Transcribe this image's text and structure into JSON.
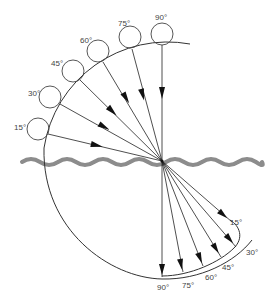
{
  "diagram": {
    "type": "refraction-of-incident-rays-at-water-surface",
    "colors": {
      "line": "#222222",
      "water": "#8c8c8c",
      "label": "#444444",
      "background": "#ffffff"
    },
    "incident_labels": [
      "15°",
      "30°",
      "45°",
      "60°",
      "75°",
      "90°"
    ],
    "refracted_labels": [
      "15°",
      "30°",
      "45°",
      "60°",
      "75°",
      "90°"
    ],
    "incident": [
      {
        "angle": "15°",
        "label_x": 17,
        "label_y": 130,
        "ball_cx": 38,
        "ball_cy": 129,
        "start_x": 48,
        "start_y": 134
      },
      {
        "angle": "30°",
        "label_x": 32,
        "label_y": 95,
        "ball_cx": 50,
        "ball_cy": 97,
        "start_x": 60,
        "start_y": 104
      },
      {
        "angle": "45°",
        "label_x": 54,
        "label_y": 65,
        "ball_cx": 73,
        "ball_cy": 71,
        "start_x": 80,
        "start_y": 80
      },
      {
        "angle": "60°",
        "label_x": 82,
        "label_y": 43,
        "ball_cx": 98,
        "ball_cy": 51,
        "start_x": 103,
        "start_y": 62
      },
      {
        "angle": "75°",
        "label_x": 120,
        "label_y": 26,
        "ball_cx": 130,
        "ball_cy": 38,
        "start_x": 132,
        "start_y": 50
      },
      {
        "angle": "90°",
        "label_x": 156,
        "label_y": 19,
        "ball_cx": 162,
        "ball_cy": 34,
        "start_x": 162,
        "start_y": 46
      }
    ],
    "refracted": [
      {
        "angle": "15°",
        "end_x": 232,
        "end_y": 222,
        "label_x": 231,
        "label_y": 225
      },
      {
        "angle": "30°",
        "end_x": 236,
        "end_y": 247,
        "label_x": 247,
        "label_y": 258
      },
      {
        "angle": "45°",
        "end_x": 221,
        "end_y": 257,
        "label_x": 223,
        "label_y": 273
      },
      {
        "angle": "60°",
        "end_x": 203,
        "end_y": 266,
        "label_x": 205,
        "label_y": 282
      },
      {
        "angle": "75°",
        "end_x": 183,
        "end_y": 272,
        "label_x": 183,
        "label_y": 289
      },
      {
        "angle": "90°",
        "end_x": 162,
        "end_y": 277,
        "label_x": 157,
        "label_y": 294
      }
    ],
    "center": {
      "x": 162,
      "y": 161
    }
  }
}
